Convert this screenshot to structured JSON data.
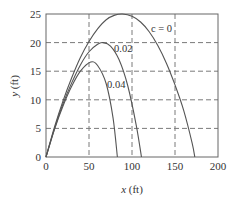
{
  "chart_data": {
    "type": "line",
    "title": "",
    "xlabel": "x (ft)",
    "ylabel": "y (ft)",
    "xlim": [
      0,
      200
    ],
    "ylim": [
      0,
      25
    ],
    "xticks": [
      0,
      50,
      100,
      150,
      200
    ],
    "yticks": [
      0,
      5,
      10,
      15,
      20,
      25
    ],
    "grid": true,
    "grid_style": "dashed",
    "legend": "inline labels on curves",
    "series": [
      {
        "name": "c = 0",
        "label": "c = 0",
        "peak": {
          "x": 89,
          "y": 25
        },
        "landing_x": 173,
        "x": [
          0,
          10,
          20,
          30,
          40,
          50,
          60,
          70,
          80,
          89,
          100,
          110,
          120,
          130,
          140,
          150,
          160,
          170,
          173
        ],
        "y": [
          0,
          5.3,
          9.9,
          13.9,
          17.4,
          20.2,
          22.4,
          24.0,
          24.8,
          25.0,
          24.6,
          23.6,
          21.9,
          19.5,
          16.4,
          12.6,
          8.2,
          2.4,
          0
        ]
      },
      {
        "name": "c = 0.02",
        "label": "0.02",
        "peak": {
          "x": 66,
          "y": 20
        },
        "landing_x": 111,
        "x": [
          0,
          10,
          20,
          30,
          40,
          50,
          60,
          66,
          75,
          85,
          95,
          105,
          111
        ],
        "y": [
          0,
          5.0,
          9.4,
          13.0,
          16.1,
          18.4,
          19.7,
          20.0,
          19.4,
          17.0,
          12.5,
          5.5,
          0
        ]
      },
      {
        "name": "c = 0.04",
        "label": "0.04",
        "peak": {
          "x": 52,
          "y": 16.6
        },
        "landing_x": 83,
        "x": [
          0,
          10,
          20,
          30,
          40,
          52,
          60,
          70,
          78,
          83
        ],
        "y": [
          0,
          4.9,
          9.0,
          12.4,
          15.0,
          16.6,
          16.0,
          12.8,
          6.8,
          0
        ]
      }
    ]
  },
  "labels": {
    "xlabel_var": "x",
    "xlabel_unit": " (ft)",
    "ylabel_var": "y",
    "ylabel_unit": " (ft)",
    "series0": "c = 0",
    "series1": "0.02",
    "series2": "0.04",
    "xticks": [
      "0",
      "50",
      "100",
      "150",
      "200"
    ],
    "yticks": [
      "0",
      "5",
      "10",
      "15",
      "20",
      "25"
    ]
  },
  "colors": {
    "axis": "#666666",
    "grid": "#7a7a7a",
    "curve": "#555555",
    "text": "#333333"
  }
}
